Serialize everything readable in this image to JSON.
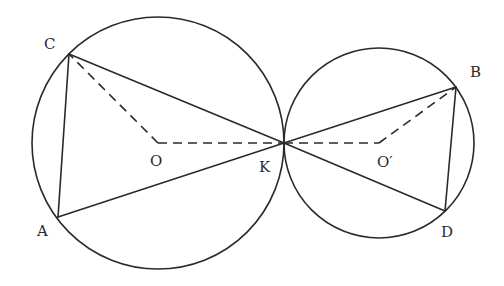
{
  "diagram": {
    "type": "geometry",
    "circles": [
      {
        "name": "large-circle",
        "center": "O"
      },
      {
        "name": "small-circle",
        "center": "O'"
      }
    ],
    "points": {
      "A": "A",
      "B": "B",
      "C": "C",
      "D": "D",
      "K": "K",
      "O": "O",
      "Oprime": "O′"
    },
    "solid_segments": [
      "CA",
      "CK",
      "AK",
      "KB",
      "KD",
      "BD"
    ],
    "dashed_segments": [
      "OC",
      "OK",
      "KO'",
      "O'B"
    ],
    "line_color": "#2a2a2a",
    "background": "#ffffff"
  }
}
